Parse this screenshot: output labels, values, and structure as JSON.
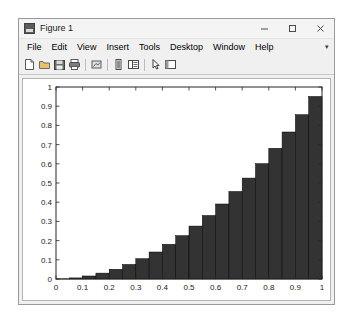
{
  "window": {
    "title": "Figure 1",
    "title_icon": "matlab-figure-icon",
    "controls": {
      "minimize": "minimize-icon",
      "maximize": "maximize-icon",
      "close": "close-icon"
    }
  },
  "menubar": {
    "items": [
      {
        "label": "File"
      },
      {
        "label": "Edit"
      },
      {
        "label": "View"
      },
      {
        "label": "Insert"
      },
      {
        "label": "Tools"
      },
      {
        "label": "Desktop"
      },
      {
        "label": "Window"
      },
      {
        "label": "Help"
      }
    ],
    "overflow": "▾"
  },
  "toolbar": {
    "buttons": [
      {
        "name": "new-figure-icon",
        "tip": "New Figure"
      },
      {
        "name": "open-file-icon",
        "tip": "Open File"
      },
      {
        "name": "save-figure-icon",
        "tip": "Save Figure"
      },
      {
        "name": "print-figure-icon",
        "tip": "Print Figure"
      },
      {
        "name": "link-plot-icon",
        "tip": "Link Plot"
      },
      {
        "name": "insert-colorbar-icon",
        "tip": "Insert Colorbar"
      },
      {
        "name": "insert-legend-icon",
        "tip": "Insert Legend"
      },
      {
        "name": "edit-plot-icon",
        "tip": "Edit Plot"
      },
      {
        "name": "show-plot-tools-icon",
        "tip": "Show Plot Tools"
      }
    ]
  },
  "chart_data": {
    "type": "bar",
    "title": "",
    "xlabel": "",
    "ylabel": "",
    "xlim": [
      0,
      1
    ],
    "ylim": [
      0,
      1
    ],
    "grid": false,
    "legend": null,
    "bar_color": "#333333",
    "bar_edge_color": "#000000",
    "axes_color": "#262626",
    "background": "#ffffff",
    "xticks": [
      0,
      0.1,
      0.2,
      0.3,
      0.4,
      0.5,
      0.6,
      0.7,
      0.8,
      0.9,
      1
    ],
    "xtick_labels": [
      "0",
      "0.1",
      "0.2",
      "0.3",
      "0.4",
      "0.5",
      "0.6",
      "0.7",
      "0.8",
      "0.9",
      "1"
    ],
    "yticks": [
      0,
      0.1,
      0.2,
      0.3,
      0.4,
      0.5,
      0.6,
      0.7,
      0.8,
      0.9,
      1
    ],
    "ytick_labels": [
      "0",
      "0.1",
      "0.2",
      "0.3",
      "0.4",
      "0.5",
      "0.6",
      "0.7",
      "0.8",
      "0.9",
      "1"
    ],
    "bar_width": 0.05,
    "x": [
      0.025,
      0.075,
      0.125,
      0.175,
      0.225,
      0.275,
      0.325,
      0.375,
      0.425,
      0.475,
      0.525,
      0.575,
      0.625,
      0.675,
      0.725,
      0.775,
      0.825,
      0.875,
      0.925,
      0.975
    ],
    "values": [
      0.0006,
      0.0056,
      0.0156,
      0.0306,
      0.0506,
      0.0756,
      0.1056,
      0.1406,
      0.1806,
      0.2256,
      0.2756,
      0.3306,
      0.3906,
      0.4556,
      0.5256,
      0.6006,
      0.6806,
      0.7656,
      0.8556,
      0.9506
    ],
    "note": "Cumulative staircase of y = x^2 over [0,1] drawn as 20 bars"
  }
}
